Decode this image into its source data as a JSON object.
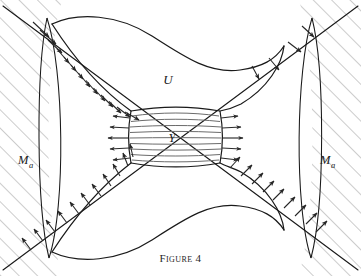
{
  "figure": {
    "caption": "Figure 4",
    "caption_number": "4",
    "background_color": "#ffffff",
    "stroke_color": "#1a1a1a",
    "hatch_color": "#9a9a9a",
    "arrow_color": "#262626",
    "inner_line_color": "#6b6b6b"
  },
  "labels": {
    "region_u": "U",
    "region_y": "Y",
    "manifold_left": "M",
    "manifold_left_sub": "a",
    "manifold_right": "M",
    "manifold_right_sub": "a"
  },
  "diagram_data": {
    "type": "diagram",
    "description": "Hourglass shaped neighborhood U with core rectangle Y, crossed by two transverse diagonal separatrix lines, bounded left and right by lens arcs, with hatched exterior regions labeled M sub a.",
    "elements": [
      {
        "name": "diagonal-line-down",
        "from": [
          4,
          8
        ],
        "to": [
          357,
          268
        ],
        "role": "separatrix"
      },
      {
        "name": "diagonal-line-up",
        "from": [
          4,
          268
        ],
        "to": [
          357,
          8
        ],
        "role": "separatrix"
      },
      {
        "name": "lens-arc-left",
        "center_x": 62,
        "role": "boundary-arc"
      },
      {
        "name": "lens-arc-right",
        "center_x": 299,
        "role": "boundary-arc"
      },
      {
        "name": "u-boundary-upper",
        "role": "region-boundary"
      },
      {
        "name": "u-boundary-lower",
        "role": "region-boundary"
      },
      {
        "name": "y-rectangle",
        "x": 131,
        "y": 111,
        "width": 89,
        "height": 52,
        "role": "core-block"
      }
    ],
    "y_inner_line_count": 9,
    "arrow_fields": [
      {
        "name": "upper-left-inflow",
        "count": 13,
        "direction": "inward-down",
        "along": "u-boundary-upper-left"
      },
      {
        "name": "lower-left-outflow",
        "count": 11,
        "direction": "outward-up-left",
        "along": "diagonal-line-up-left"
      },
      {
        "name": "upper-right-outflow",
        "count": 4,
        "direction": "outward-up-right",
        "along": "diagonal-line-up-right"
      },
      {
        "name": "lower-right-outflow",
        "count": 9,
        "direction": "outward-up-right",
        "along": "u-boundary-lower-right"
      },
      {
        "name": "y-left-flow",
        "count": 5,
        "direction": "left",
        "along": "y-rectangle-left-edge"
      },
      {
        "name": "y-right-flow",
        "count": 5,
        "direction": "right",
        "along": "y-rectangle-right-edge"
      }
    ],
    "hatched_regions": [
      {
        "name": "hatch-left",
        "label": "M_a",
        "angle_deg": -45
      },
      {
        "name": "hatch-right",
        "label": "M_a",
        "angle_deg": -45
      }
    ]
  }
}
